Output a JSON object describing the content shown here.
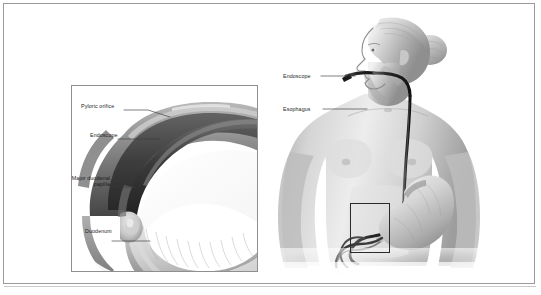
{
  "figure": {
    "kind": "medical-illustration",
    "style": "grayscale anatomical airbrush drawing",
    "background_color": "#ffffff",
    "frame_color": "#9a9a9a",
    "label_color": "#1c1c1c",
    "leader_color": "#3a3a3a"
  },
  "inset": {
    "title": "duodenum detail",
    "border_color": "#8f8f8f",
    "labels": [
      {
        "id": "pyloric-orifice",
        "text": "Pyloric orifice"
      },
      {
        "id": "endoscope",
        "text": "Endoscope"
      },
      {
        "id": "major-duodenal-papilla",
        "text": "Major duodenal papilla"
      },
      {
        "id": "duodenum",
        "text": "Duodenum"
      }
    ],
    "papilla_line1": "Major duodenal",
    "papilla_line2": "papilla"
  },
  "body_figure": {
    "description": "female head and torso in profile with endoscope passing through mouth, esophagus and stomach",
    "labels": [
      {
        "id": "endoscope",
        "text": "Endoscope"
      },
      {
        "id": "esophagus",
        "text": "Esophagus"
      }
    ],
    "detail_box": {
      "name": "duodenum-detail-box",
      "stroke": "#2b2b2b"
    }
  }
}
